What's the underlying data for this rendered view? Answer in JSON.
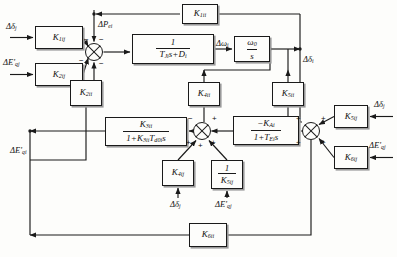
{
  "diagram": {
    "blocks": [
      {
        "id": "k1ij",
        "name": "gain-k1ij",
        "type": "gain",
        "label": "K",
        "sub": "1ij",
        "x": 35,
        "y": 26,
        "w": 48,
        "h": 23
      },
      {
        "id": "k2ij",
        "name": "gain-k2ij",
        "type": "gain",
        "label": "K",
        "sub": "2ij",
        "x": 35,
        "y": 63,
        "w": 48,
        "h": 23
      },
      {
        "id": "k2ii",
        "name": "gain-k2ii",
        "type": "gain",
        "label": "K",
        "sub": "2ii",
        "x": 70,
        "y": 80,
        "w": 32,
        "h": 26
      },
      {
        "id": "inertia",
        "name": "inertia-transfer-block",
        "type": "fraction",
        "num": "1",
        "den_pre": "T",
        "den_sub": "Jis",
        "den_post": "+D",
        "den_post_sub": "i",
        "x": 132,
        "y": 34,
        "w": 82,
        "h": 30
      },
      {
        "id": "integ",
        "name": "integrator-block",
        "type": "fraction2",
        "num_pre": "ω",
        "num_sub": "0",
        "den": "s",
        "x": 234,
        "y": 36,
        "w": 36,
        "h": 26
      },
      {
        "id": "k1ii",
        "name": "gain-k1ii",
        "type": "gain",
        "label": "K",
        "sub": "1ii",
        "x": 182,
        "y": 4,
        "w": 36,
        "h": 20
      },
      {
        "id": "k4ii",
        "name": "gain-k4ii",
        "type": "gain",
        "label": "K",
        "sub": "4ii",
        "x": 188,
        "y": 82,
        "w": 32,
        "h": 24
      },
      {
        "id": "k5ii",
        "name": "gain-k5ii",
        "type": "gain",
        "label": "K",
        "sub": "5ii",
        "x": 272,
        "y": 82,
        "w": 32,
        "h": 24
      },
      {
        "id": "field",
        "name": "field-circuit-block",
        "type": "fraction3",
        "num_pre": "K",
        "num_sub": "3ii",
        "den": "1+K",
        "den_sub": "3ii",
        "den_post": "T",
        "den_post_sub": "d0i",
        "den_tail": "s",
        "x": 105,
        "y": 117,
        "w": 82,
        "h": 29
      },
      {
        "id": "exc",
        "name": "exciter-block",
        "type": "fraction4",
        "num_pre": "−K",
        "num_sub": "Ai",
        "den": "1+T",
        "den_sub": "Ei",
        "den_tail": "s",
        "x": 233,
        "y": 116,
        "w": 66,
        "h": 29
      },
      {
        "id": "k4ij",
        "name": "gain-k4ij",
        "type": "gain",
        "label": "K",
        "sub": "4ij",
        "x": 162,
        "y": 160,
        "w": 32,
        "h": 26
      },
      {
        "id": "k5ijinv",
        "name": "gain-inv-k5ij",
        "type": "invgain",
        "num": "1",
        "den": "K",
        "den_sub": "5ij",
        "x": 211,
        "y": 160,
        "w": 32,
        "h": 29
      },
      {
        "id": "k5ij",
        "name": "gain-k5ij",
        "type": "gain",
        "label": "K",
        "sub": "5ij",
        "x": 334,
        "y": 105,
        "w": 34,
        "h": 23
      },
      {
        "id": "k6ij",
        "name": "gain-k6ij",
        "type": "gain",
        "label": "K",
        "sub": "6ij",
        "x": 334,
        "y": 146,
        "w": 34,
        "h": 23
      },
      {
        "id": "k6ii",
        "name": "gain-k6ii",
        "type": "gain",
        "label": "K",
        "sub": "6ii",
        "x": 189,
        "y": 223,
        "w": 38,
        "h": 24
      }
    ],
    "summers": [
      {
        "id": "sum1",
        "name": "summing-junction-torque",
        "cx": 94,
        "cy": 52,
        "r": 9
      },
      {
        "id": "sum2",
        "name": "summing-junction-field",
        "cx": 202,
        "cy": 131,
        "r": 9
      },
      {
        "id": "sum3",
        "name": "summing-junction-excitation",
        "cx": 311,
        "cy": 131,
        "r": 9
      }
    ],
    "signs": [
      {
        "name": "sign-minus-sum1-a",
        "text": "−",
        "x": 84,
        "y": 40
      },
      {
        "name": "sign-minus-sum1-b",
        "text": "−",
        "x": 98,
        "y": 40
      },
      {
        "name": "sign-minus-sum1-c",
        "text": "−",
        "x": 82,
        "y": 58
      },
      {
        "name": "sign-minus-sum1-d",
        "text": "−",
        "x": 98,
        "y": 61
      },
      {
        "name": "sign-minus-sum2-top",
        "text": "−",
        "x": 192,
        "y": 119
      },
      {
        "name": "sign-plus-sum2-right",
        "text": "+",
        "x": 212,
        "y": 119
      },
      {
        "name": "sign-plus-sum2-bl",
        "text": "+",
        "x": 190,
        "y": 140
      },
      {
        "name": "sign-plus-sum2-b",
        "text": "+",
        "x": 200,
        "y": 142
      },
      {
        "name": "sign-plus-sum2-br",
        "text": "+",
        "x": 211,
        "y": 140
      },
      {
        "name": "sign-plus-sum3-tl",
        "text": "+",
        "x": 300,
        "y": 119
      },
      {
        "name": "sign-plus-sum3-tr",
        "text": "+",
        "x": 321,
        "y": 119
      },
      {
        "name": "sign-plus-sum3-bl",
        "text": "+",
        "x": 300,
        "y": 140
      },
      {
        "name": "sign-plus-sum3-br",
        "text": "+",
        "x": 321,
        "y": 140
      }
    ],
    "labels": [
      {
        "id": "in_dd",
        "name": "label-input-delta-delta-j",
        "html": "Δ<i>δ</i><sub>j</sub>",
        "x": 6,
        "y": 14
      },
      {
        "id": "in_deq",
        "name": "label-input-delta-eq-j",
        "html": "Δ<i>E'</i><sub>qj</sub>",
        "x": 4,
        "y": 53
      },
      {
        "id": "dpei",
        "name": "label-delta-pei",
        "html": "Δ<i>P</i><sub>ei</sub>",
        "x": 97,
        "y": 18
      },
      {
        "id": "domegai",
        "name": "label-delta-omega-i",
        "html": "Δ<i>ω</i><sub>i</sub>",
        "x": 197,
        "y": 41
      },
      {
        "id": "ddeltai",
        "name": "label-delta-delta-i",
        "html": "Δ<i>δ</i><sub>i</sub>",
        "x": 305,
        "y": 54
      },
      {
        "id": "deqi",
        "name": "label-delta-eq-i",
        "html": "Δ<i>E'</i><sub>qi</sub>",
        "x": 14,
        "y": 146
      },
      {
        "id": "in_dd2",
        "name": "label-input-delta-delta-j-2",
        "html": "Δ<i>δ</i><sub>j</sub>",
        "x": 169,
        "y": 201
      },
      {
        "id": "in_deq2",
        "name": "label-input-delta-eq-j-2",
        "html": "Δ<i>E'</i><sub>qj</sub>",
        "x": 213,
        "y": 201
      },
      {
        "id": "in_dd3",
        "name": "label-input-delta-delta-j-3",
        "html": "Δ<i>δ</i><sub>j</sub>",
        "x": 379,
        "y": 97
      },
      {
        "id": "in_deq3",
        "name": "label-input-delta-eq-j-3",
        "html": "Δ<i>E'</i><sub>qj</sub>",
        "x": 373,
        "y": 138
      }
    ]
  }
}
